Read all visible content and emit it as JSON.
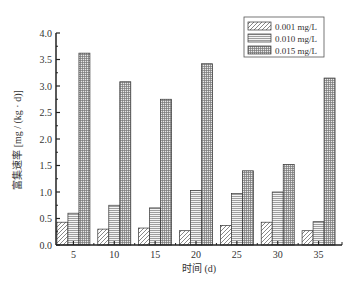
{
  "chart_data": {
    "type": "bar",
    "title": "",
    "xlabel": "时间 (d)",
    "ylabel": "富集速率 [mg / (kg · d)]",
    "categories": [
      "5",
      "10",
      "15",
      "20",
      "25",
      "30",
      "35"
    ],
    "ylim": [
      0,
      4.0
    ],
    "yticks": [
      "0.0",
      "0.5",
      "1.0",
      "1.5",
      "2.0",
      "2.5",
      "3.0",
      "3.5",
      "4.0"
    ],
    "grid": false,
    "legend_position": "upper right",
    "series": [
      {
        "name": "0.001 mg/L",
        "pattern": "diagonal-hatch",
        "values": [
          0.43,
          0.3,
          0.32,
          0.27,
          0.37,
          0.43,
          0.27
        ]
      },
      {
        "name": "0.010 mg/L",
        "pattern": "horizontal-lines",
        "values": [
          0.6,
          0.75,
          0.7,
          1.03,
          0.97,
          1.0,
          0.44
        ]
      },
      {
        "name": "0.015 mg/L",
        "pattern": "grid",
        "values": [
          3.62,
          3.08,
          2.75,
          3.42,
          1.4,
          1.52,
          3.15
        ]
      }
    ]
  }
}
